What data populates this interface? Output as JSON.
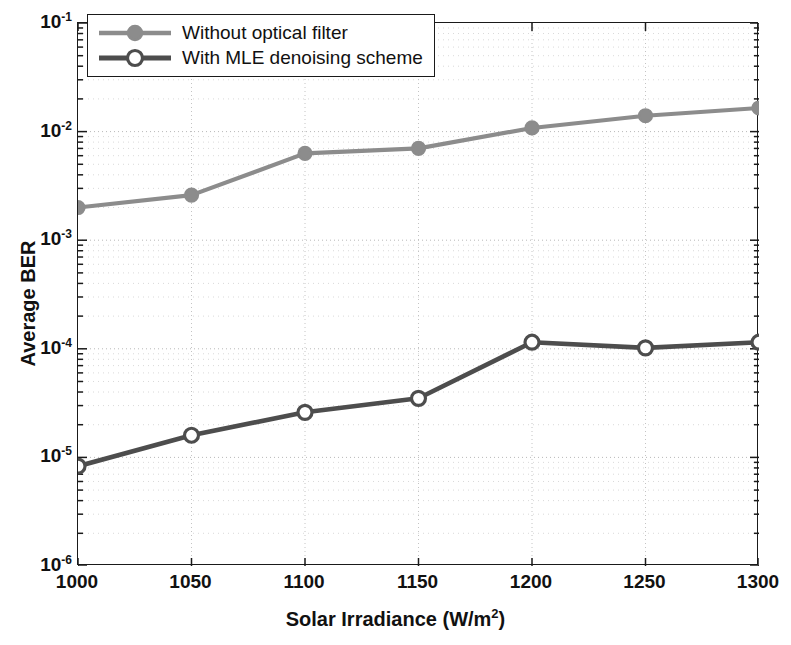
{
  "chart_data": {
    "type": "line",
    "title": "",
    "xlabel": "Solar Irradiance (W/m2)",
    "xlabel_base": "Solar Irradiance (W/m",
    "xlabel_sup": "2",
    "xlabel_tail": ")",
    "ylabel": "Average BER",
    "yscale": "log",
    "xlim": [
      1000,
      1300
    ],
    "ylim": [
      1e-06,
      0.1
    ],
    "grid": true,
    "grid_style": "dotted",
    "legend_position": "top-left",
    "x": [
      1000,
      1050,
      1100,
      1150,
      1200,
      1250,
      1300
    ],
    "xticklabels": [
      "1000",
      "1050",
      "1100",
      "1150",
      "1200",
      "1250",
      "1300"
    ],
    "yticklabels": [
      "10-1",
      "10-2",
      "10-3",
      "10-4",
      "10-5",
      "10-6"
    ],
    "yticks": [
      0.1,
      0.01,
      0.001,
      0.0001,
      1e-05,
      1e-06
    ],
    "series": [
      {
        "name": "Without optical filter",
        "color": "#8c8c8c",
        "marker": "filled-circle",
        "values": [
          0.002,
          0.0026,
          0.0063,
          0.007,
          0.0108,
          0.014,
          0.0165
        ]
      },
      {
        "name": "With MLE denoising scheme",
        "color": "#4d4d4d",
        "marker": "open-circle",
        "values": [
          8.3e-06,
          1.6e-05,
          2.6e-05,
          3.5e-05,
          0.000115,
          0.000102,
          0.000115
        ]
      }
    ]
  },
  "legend": {
    "items": [
      {
        "label": "Without optical filter"
      },
      {
        "label": "With MLE denoising scheme"
      }
    ]
  },
  "axis": {
    "y_exponents": [
      "-1",
      "-2",
      "-3",
      "-4",
      "-5",
      "-6"
    ],
    "y_mantissa": "10"
  }
}
